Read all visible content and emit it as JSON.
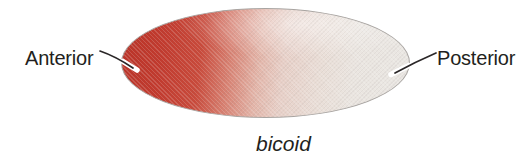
{
  "labels": {
    "anterior": "Anterior",
    "posterior": "Posterior",
    "gene": "bicoid"
  },
  "icons": {
    "anterior_leader_line": "line from Anterior label to left tip of ellipse",
    "posterior_leader_line": "line from right tip of ellipse to Posterior label"
  },
  "colors": {
    "background": "#ffffff",
    "text": "#231f20",
    "leader_line": "#2b2728",
    "embryo_outline": "#a8a4a1",
    "gradient_anterior": "#c23a2e",
    "gradient_mid": "#e7cfc7",
    "gradient_posterior": "#eae7e3"
  }
}
